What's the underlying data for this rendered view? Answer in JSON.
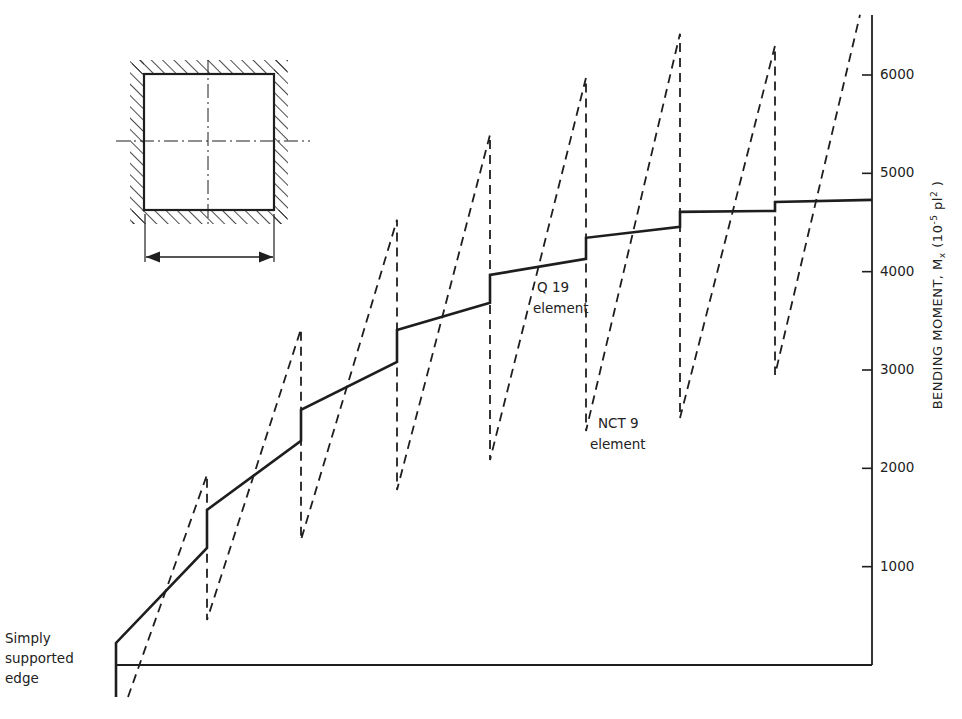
{
  "chart_data": {
    "type": "line",
    "title": "",
    "xlabel": "",
    "ylabel": "BENDING MOMENT, Mx (10^-5 pl^2)",
    "ylabel_parts": {
      "main": "BENDING MOMENT, M",
      "sub": "x",
      "paren_open": " (10",
      "sup1": "-5",
      "mid": " pl",
      "sup2": "2",
      "paren_close": " )"
    },
    "ylim": [
      0,
      6600
    ],
    "yticks": [
      1000,
      2000,
      3000,
      4000,
      5000,
      6000
    ],
    "grid": false,
    "legend": "inline annotations",
    "series": [
      {
        "name": "Q 19 element",
        "style": "solid",
        "points": [
          [
            116,
            -325
          ],
          [
            116,
            225
          ],
          [
            207,
            1190
          ],
          [
            207,
            1577
          ],
          [
            301,
            2280
          ],
          [
            301,
            2594
          ],
          [
            397,
            3082
          ],
          [
            397,
            3408
          ],
          [
            490,
            3683
          ],
          [
            490,
            3967
          ],
          [
            586,
            4130
          ],
          [
            586,
            4344
          ],
          [
            680,
            4456
          ],
          [
            680,
            4608
          ],
          [
            775,
            4618
          ],
          [
            775,
            4710
          ],
          [
            872,
            4730
          ]
        ]
      },
      {
        "name": "NCT 9 element",
        "style": "dashed",
        "points": [
          [
            128,
            -325
          ],
          [
            207,
            1935
          ],
          [
            207,
            458
          ],
          [
            301,
            3418
          ],
          [
            301,
            1272
          ],
          [
            397,
            4527
          ],
          [
            397,
            1780
          ],
          [
            490,
            5393
          ],
          [
            490,
            2085
          ],
          [
            586,
            5973
          ],
          [
            586,
            2380
          ],
          [
            680,
            6420
          ],
          [
            680,
            2512
          ],
          [
            775,
            6297
          ],
          [
            775,
            2950
          ],
          [
            860,
            6612
          ]
        ]
      }
    ],
    "annotations": [
      {
        "text": "Simply",
        "x": 5,
        "y": 640
      },
      {
        "text": "supported",
        "x": 5,
        "y": 660
      },
      {
        "text": "edge",
        "x": 5,
        "y": 680
      },
      {
        "text": "Q 19",
        "x": 537,
        "y": 280
      },
      {
        "text": "element",
        "x": 533,
        "y": 301
      },
      {
        "text": "NCT 9",
        "x": 597,
        "y": 416
      },
      {
        "text": "element",
        "x": 589,
        "y": 437
      }
    ]
  },
  "axis": {
    "ticks": [
      {
        "label": "1000",
        "value": 1000
      },
      {
        "label": "2000",
        "value": 2000
      },
      {
        "label": "3000",
        "value": 3000
      },
      {
        "label": "4000",
        "value": 4000
      },
      {
        "label": "5000",
        "value": 5000
      },
      {
        "label": "6000",
        "value": 6000
      }
    ]
  },
  "labels": {
    "edge_line1": "Simply",
    "edge_line2": "supported",
    "edge_line3": "edge",
    "q19_line1": "Q 19",
    "q19_line2": "element",
    "nct9_line1": "NCT 9",
    "nct9_line2": "element"
  },
  "inset": {
    "description": "square plate with clamped (hatched) edges, centerlines, and span dimension arrow"
  },
  "colors": {
    "ink": "#1e1e1e",
    "background": "#ffffff"
  }
}
